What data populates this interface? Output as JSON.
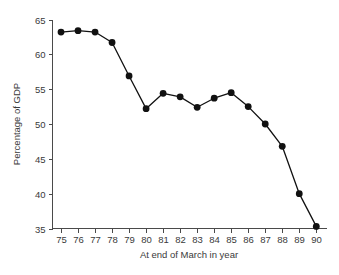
{
  "chart_data": {
    "type": "line",
    "title": "",
    "subtitle": "",
    "xlabel": "At end of March in year",
    "ylabel": "Percentage of GDP",
    "categories": [
      "75",
      "76",
      "77",
      "78",
      "79",
      "80",
      "81",
      "82",
      "83",
      "84",
      "85",
      "86",
      "87",
      "88",
      "89",
      "90"
    ],
    "x": [
      75,
      76,
      77,
      78,
      79,
      80,
      81,
      82,
      83,
      84,
      85,
      86,
      87,
      88,
      89,
      90
    ],
    "values": [
      63.2,
      63.4,
      63.2,
      61.7,
      56.9,
      52.2,
      54.4,
      53.9,
      52.4,
      53.7,
      54.5,
      52.5,
      50.0,
      46.8,
      40.0,
      35.3
    ],
    "series": [
      {
        "name": "Percentage of GDP",
        "values": [
          63.2,
          63.4,
          63.2,
          61.7,
          56.9,
          52.2,
          54.4,
          53.9,
          52.4,
          53.7,
          54.5,
          52.5,
          50.0,
          46.8,
          40.0,
          35.3
        ]
      }
    ],
    "xlim": [
      74.5,
      90.6
    ],
    "ylim": [
      35,
      65
    ],
    "xticks": [
      75,
      76,
      77,
      78,
      79,
      80,
      81,
      82,
      83,
      84,
      85,
      86,
      87,
      88,
      89,
      90
    ],
    "xtick_labels": [
      "75",
      "76",
      "77",
      "78",
      "79",
      "80",
      "81",
      "82",
      "83",
      "84",
      "85",
      "86",
      "87",
      "88",
      "89",
      "90"
    ],
    "yticks": [
      35,
      40,
      45,
      50,
      55,
      60,
      65
    ],
    "ytick_labels": [
      "35",
      "40",
      "45",
      "50",
      "55",
      "60",
      "65"
    ],
    "grid": false,
    "legend": false,
    "legend_position": "none",
    "marker": "filled-circle",
    "line_color": "#111111",
    "marker_color": "#111111",
    "axis_color": "#4a4a4a",
    "text_color": "#3a3a3a",
    "background": "#ffffff"
  }
}
